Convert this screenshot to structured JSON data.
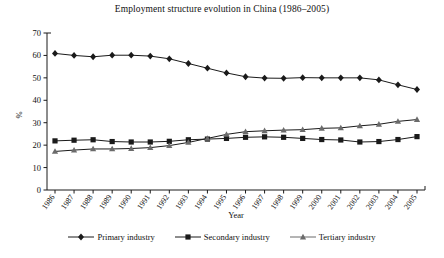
{
  "chart_data": {
    "type": "line",
    "title": "Employment structure evolution in China (1986–2005)",
    "xlabel": "Year",
    "ylabel": "%",
    "ylim": [
      0,
      70
    ],
    "yticks": [
      0,
      10,
      20,
      30,
      40,
      50,
      60,
      70
    ],
    "grid": false,
    "legend_position": "bottom",
    "categories": [
      "1986",
      "1987",
      "1988",
      "1989",
      "1990",
      "1991",
      "1992",
      "1993",
      "1994",
      "1995",
      "1996",
      "1997",
      "1998",
      "1999",
      "2000",
      "2001",
      "2002",
      "2003",
      "2004",
      "2005"
    ],
    "series": [
      {
        "name": "Primary industry",
        "marker": "diamond",
        "color": "#1a1a1a",
        "values": [
          60.9,
          60.0,
          59.4,
          60.1,
          60.1,
          59.7,
          58.5,
          56.4,
          54.3,
          52.2,
          50.5,
          49.9,
          49.8,
          50.1,
          50.0,
          50.0,
          50.0,
          49.1,
          46.9,
          44.8
        ]
      },
      {
        "name": "Secondary industry",
        "marker": "square",
        "color": "#1a1a1a",
        "values": [
          21.9,
          22.2,
          22.4,
          21.6,
          21.4,
          21.4,
          21.7,
          22.4,
          22.7,
          23.0,
          23.5,
          23.7,
          23.5,
          23.0,
          22.5,
          22.3,
          21.4,
          21.6,
          22.5,
          23.8
        ]
      },
      {
        "name": "Tertiary industry",
        "marker": "triangle",
        "color": "#6b6b6b",
        "values": [
          17.2,
          17.8,
          18.3,
          18.3,
          18.5,
          18.9,
          19.8,
          21.2,
          23.0,
          24.8,
          26.0,
          26.4,
          26.7,
          26.9,
          27.5,
          27.7,
          28.6,
          29.3,
          30.6,
          31.4
        ]
      }
    ]
  }
}
